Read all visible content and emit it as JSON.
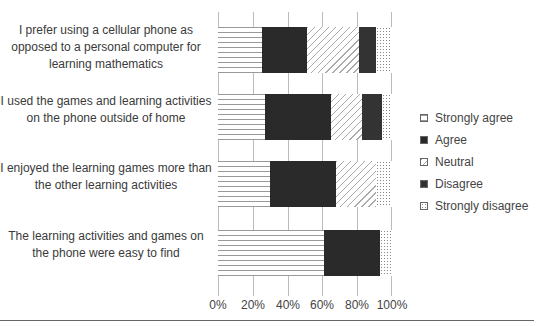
{
  "chart_data": {
    "type": "bar",
    "orientation": "horizontal",
    "stacked": true,
    "title": "",
    "xlabel": "",
    "ylabel": "",
    "xlim": [
      0,
      100
    ],
    "x_ticks": [
      "0%",
      "20%",
      "40%",
      "60%",
      "80%",
      "100%"
    ],
    "grid": true,
    "legend_position": "right",
    "categories": [
      "I prefer using a cellular phone as opposed to a personal computer for learning mathematics",
      "I used the games and learning activities on the phone outside of home",
      "I enjoyed the learning games more than the other learning activities",
      "The learning activities and games on the phone were easy to find"
    ],
    "series": [
      {
        "name": "Strongly agree",
        "values": [
          25,
          27,
          30,
          61
        ]
      },
      {
        "name": "Agree",
        "values": [
          26,
          38,
          38,
          32
        ]
      },
      {
        "name": "Neutral",
        "values": [
          30,
          18,
          23,
          0
        ]
      },
      {
        "name": "Disagree",
        "values": [
          10,
          11,
          0,
          0
        ]
      },
      {
        "name": "Strongly disagree",
        "values": [
          9,
          6,
          9,
          7
        ]
      }
    ]
  },
  "labels": [
    "I prefer using a cellular phone as opposed to a personal computer for learning mathematics",
    "I used the games and learning activities on the phone outside of home",
    "I enjoyed the learning games more than the other learning activities",
    "The learning activities and games on the phone were easy to find"
  ],
  "ticks": [
    "0%",
    "20%",
    "40%",
    "60%",
    "80%",
    "100%"
  ],
  "legend": [
    "Strongly agree",
    "Agree",
    "Neutral",
    "Disagree",
    "Strongly disagree"
  ]
}
